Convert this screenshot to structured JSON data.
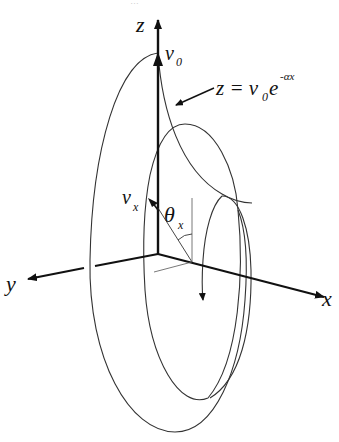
{
  "figure": {
    "top_cropped_text": "…",
    "axes": {
      "z_label": "z",
      "y_label": "y",
      "x_label": "x"
    },
    "labels": {
      "v0_main": "v",
      "v0_sub": "0",
      "vx_main": "v",
      "vx_sub": "x",
      "theta_main": "θ",
      "theta_sub": "x"
    },
    "equation": {
      "lhs": "z = v",
      "v_sub": "0",
      "base": "e",
      "exponent": "-αx"
    },
    "colors": {
      "stroke": "#111111",
      "curve": "#333333",
      "background": "#ffffff"
    }
  }
}
